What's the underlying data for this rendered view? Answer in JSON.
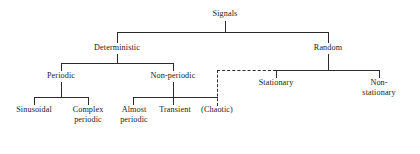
{
  "diagram": {
    "type": "hierarchy-tree",
    "line_color": "#2b2b2b",
    "background_color": "#ffffff",
    "text_color": "#1a1a1a",
    "nodes": {
      "signals": {
        "label": "Signals",
        "level": 0
      },
      "deterministic": {
        "label": "Deterministic",
        "level": 1
      },
      "random": {
        "label": "Random",
        "level": 1
      },
      "periodic": {
        "label": "Periodic",
        "level": 2
      },
      "non_periodic": {
        "label": "Non-periodic",
        "level": 2
      },
      "stationary": {
        "label": "Stationary",
        "level": 2
      },
      "non_stationary": {
        "label": "Non-stationary",
        "level": 2
      },
      "sinusoidal": {
        "label": "Sinusoidal",
        "level": 3
      },
      "complex_periodic": {
        "label": "Complex\nperiodic",
        "level": 3
      },
      "almost_periodic": {
        "label": "Almost\nperiodic",
        "level": 3
      },
      "transient": {
        "label": "Transient",
        "level": 3
      },
      "chaotic": {
        "label": "(Chaotic)",
        "level": 3
      }
    },
    "edges": [
      {
        "from": "signals",
        "to": "deterministic",
        "style": "solid"
      },
      {
        "from": "signals",
        "to": "random",
        "style": "solid"
      },
      {
        "from": "deterministic",
        "to": "periodic",
        "style": "solid"
      },
      {
        "from": "deterministic",
        "to": "non_periodic",
        "style": "solid"
      },
      {
        "from": "random",
        "to": "stationary",
        "style": "solid"
      },
      {
        "from": "random",
        "to": "non_stationary",
        "style": "solid"
      },
      {
        "from": "periodic",
        "to": "sinusoidal",
        "style": "solid"
      },
      {
        "from": "periodic",
        "to": "complex_periodic",
        "style": "solid"
      },
      {
        "from": "non_periodic",
        "to": "almost_periodic",
        "style": "solid"
      },
      {
        "from": "non_periodic",
        "to": "transient",
        "style": "solid"
      },
      {
        "from": "non_periodic",
        "to": "chaotic",
        "style": "solid"
      },
      {
        "from": "stationary_branch",
        "to": "chaotic",
        "style": "dashed"
      }
    ]
  }
}
